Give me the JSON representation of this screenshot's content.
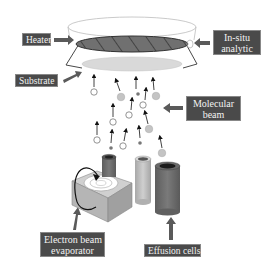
{
  "diagram": {
    "labels": {
      "heater": "Heater",
      "substrate": "Substrate",
      "insitu_line1": "In-situ",
      "insitu_line2": "analytic",
      "molecular_line1": "Molecular",
      "molecular_line2": "beam",
      "ebeam_line1": "Electron beam",
      "ebeam_line2": "evaporator",
      "effusion": "Effusion cells"
    },
    "colors": {
      "label_bg": "#4a4a4a",
      "label_text": "#f2f2f2",
      "heater_fill": "#6e6e6e",
      "substrate_fill": "#d9d9d9",
      "arrow_fill": "#5a5a5a",
      "particle_large": "#c4c4c4",
      "particle_small": "#777777",
      "cell_dark": "#6a6a6a",
      "cell_light": "#bdbdbd",
      "evaporator_box": "#b9b9b9"
    },
    "particles": [
      {
        "type": "open",
        "cx": 94,
        "cy": 92
      },
      {
        "type": "large",
        "cx": 121,
        "cy": 97
      },
      {
        "type": "small",
        "cx": 138,
        "cy": 94
      },
      {
        "type": "large",
        "cx": 156,
        "cy": 96
      },
      {
        "type": "open",
        "cx": 143,
        "cy": 105
      },
      {
        "type": "open",
        "cx": 129,
        "cy": 115
      },
      {
        "type": "open",
        "cx": 113,
        "cy": 122
      },
      {
        "type": "large",
        "cx": 149,
        "cy": 129
      },
      {
        "type": "open",
        "cx": 97,
        "cy": 140
      },
      {
        "type": "small",
        "cx": 111,
        "cy": 148
      },
      {
        "type": "open",
        "cx": 123,
        "cy": 146
      },
      {
        "type": "small",
        "cx": 140,
        "cy": 143
      },
      {
        "type": "large",
        "cx": 162,
        "cy": 153
      }
    ]
  }
}
